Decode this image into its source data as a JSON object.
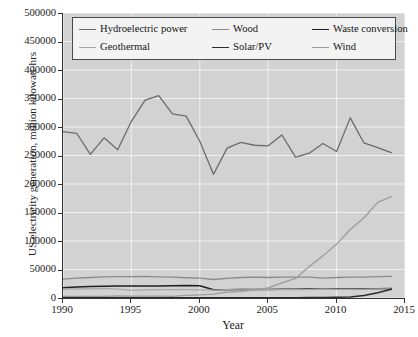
{
  "figure": {
    "background_color": "#ffffff",
    "plot_background_color": "#d2d2d2",
    "gridline_color": "#f0f0f0",
    "axis_color": "#333333"
  },
  "axes": {
    "y_axis_title": "US electricity generation, million kilowatt-hrs",
    "x_axis_title": "Year",
    "y_ticks": [
      "0",
      "50000",
      "100000",
      "150000",
      "200000",
      "250000",
      "300000",
      "350000",
      "400000",
      "450000",
      "500000"
    ],
    "x_ticks": [
      "1990",
      "1995",
      "2000",
      "2005",
      "2010",
      "2015"
    ]
  },
  "legend": {
    "entries": [
      {
        "label": "Hydroelectric power",
        "color": "#6b6b6b",
        "width": "1.5"
      },
      {
        "label": "Wood",
        "color": "#8a8a8a",
        "width": "1.4"
      },
      {
        "label": "Waste conversion",
        "color": "#1f1f1f",
        "width": "1.6"
      },
      {
        "label": "Geothermal",
        "color": "#a8a8a8",
        "width": "1.3"
      },
      {
        "label": "Solar/PV",
        "color": "#2b2b2b",
        "width": "1.6"
      },
      {
        "label": "Wind",
        "color": "#9b9b9b",
        "width": "1.5"
      }
    ]
  },
  "chart_data": {
    "type": "line",
    "title": "",
    "xlabel": "Year",
    "ylabel": "US electricity generation, million kilowatt-hrs",
    "xlim": [
      1990,
      2015
    ],
    "ylim": [
      0,
      500000
    ],
    "grid": true,
    "legend_position": "upper-center-inside",
    "x": [
      1990,
      1991,
      1992,
      1993,
      1994,
      1995,
      1996,
      1997,
      1998,
      1999,
      2000,
      2001,
      2002,
      2003,
      2004,
      2005,
      2006,
      2007,
      2008,
      2009,
      2010,
      2011,
      2012,
      2013,
      2014
    ],
    "series": [
      {
        "name": "Hydroelectric power",
        "color": "#6b6b6b",
        "values": [
          292000,
          289000,
          252000,
          281000,
          260000,
          310000,
          347000,
          355000,
          323000,
          319000,
          275000,
          217000,
          263000,
          273000,
          268000,
          267000,
          286000,
          247000,
          254000,
          271000,
          257000,
          316000,
          272000,
          264000,
          255000
        ]
      },
      {
        "name": "Wood",
        "color": "#8a8a8a",
        "values": [
          33000,
          35000,
          36000,
          37000,
          37500,
          37500,
          38000,
          37000,
          36500,
          35500,
          35000,
          32500,
          34500,
          36000,
          36500,
          36000,
          36500,
          36500,
          36500,
          35000,
          36000,
          36500,
          36500,
          37500,
          38000
        ]
      },
      {
        "name": "Waste conversion",
        "color": "#1f1f1f",
        "values": [
          18000,
          19500,
          20000,
          20500,
          21000,
          21000,
          21200,
          21200,
          21500,
          21800,
          21500,
          14500,
          14500,
          14800,
          14900,
          15000,
          15200,
          15500,
          15800,
          15500,
          15800,
          16000,
          16200,
          16400,
          16600
        ]
      },
      {
        "name": "Geothermal",
        "color": "#a8a8a8",
        "values": [
          15500,
          15900,
          16100,
          16800,
          15500,
          13400,
          14300,
          14700,
          14800,
          14800,
          14100,
          13700,
          14500,
          14420,
          14810,
          14690,
          14570,
          14600,
          14840,
          15000,
          15200,
          15300,
          15600,
          15800,
          15900
        ]
      },
      {
        "name": "Solar/PV",
        "color": "#2b2b2b",
        "values": [
          370,
          450,
          440,
          470,
          490,
          500,
          510,
          490,
          500,
          500,
          500,
          540,
          550,
          530,
          570,
          550,
          510,
          610,
          860,
          890,
          1210,
          1820,
          4330,
          9040,
          15250
        ]
      },
      {
        "name": "Wind",
        "color": "#9b9b9b",
        "values": [
          3000,
          2700,
          2900,
          3000,
          3500,
          3200,
          3200,
          3300,
          3000,
          4500,
          5600,
          6700,
          10400,
          11200,
          14100,
          17800,
          26600,
          34400,
          55400,
          73900,
          94600,
          120200,
          140800,
          167800,
          178000
        ]
      }
    ]
  }
}
